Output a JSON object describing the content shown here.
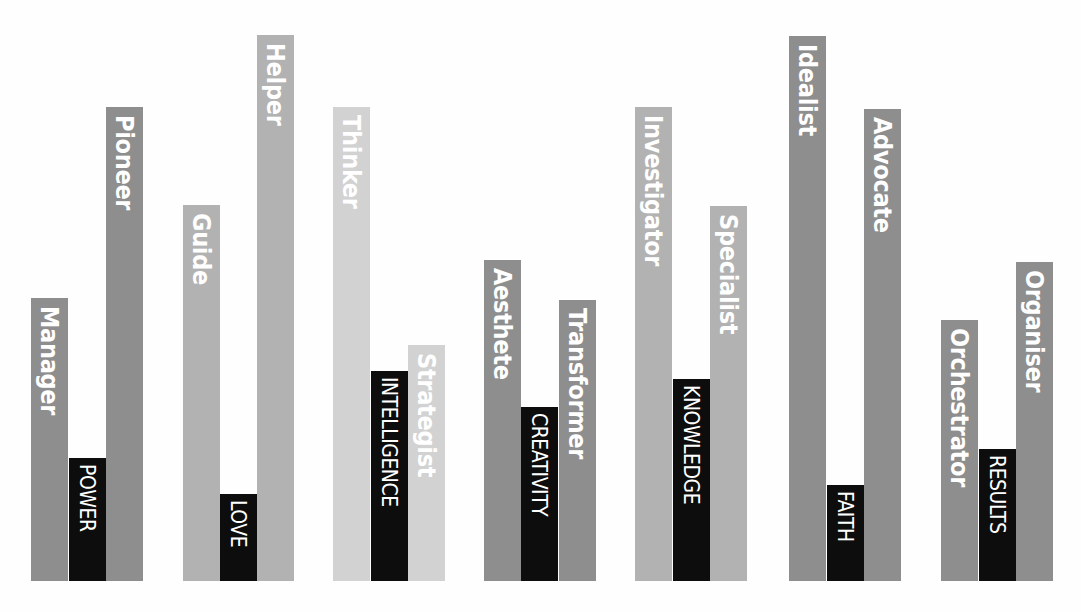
{
  "colors": {
    "dark": "#8e8e8e",
    "mid": "#b2b2b2",
    "light": "#d2d2d2",
    "core": "#0d0d0d"
  },
  "chart_data": {
    "type": "bar",
    "title": "",
    "xlabel": "",
    "ylabel": "",
    "baseline_y_px": 581,
    "groups": [
      {
        "core": "POWER",
        "left": "Manager",
        "right": "Pioneer",
        "shade": "dark",
        "values": {
          "left": 283,
          "core": 123,
          "right": 474
        }
      },
      {
        "core": "LOVE",
        "left": "Guide",
        "right": "Helper",
        "shade": "mid",
        "values": {
          "left": 376,
          "core": 87,
          "right": 546
        }
      },
      {
        "core": "INTELLIGENCE",
        "left": "Thinker",
        "right": "Strategist",
        "shade": "light",
        "values": {
          "left": 474,
          "core": 210,
          "right": 236
        }
      },
      {
        "core": "CREATIVITY",
        "left": "Aesthete",
        "right": "Transformer",
        "shade": "dark",
        "values": {
          "left": 321,
          "core": 174,
          "right": 281
        }
      },
      {
        "core": "KNOWLEDGE",
        "left": "Investigator",
        "right": "Specialist",
        "shade": "mid",
        "values": {
          "left": 474,
          "core": 202,
          "right": 375
        }
      },
      {
        "core": "FAITH",
        "left": "Idealist",
        "right": "Advocate",
        "shade": "dark",
        "values": {
          "left": 545,
          "core": 96,
          "right": 472
        }
      },
      {
        "core": "RESULTS",
        "left": "Orchestrator",
        "right": "Organiser",
        "shade": "dark",
        "values": {
          "left": 261,
          "core": 132,
          "right": 319
        }
      }
    ]
  },
  "bars": [
    {
      "name": "manager",
      "label": "Manager",
      "x": 31,
      "top": 298,
      "shade": "dark"
    },
    {
      "name": "power",
      "label": "POWER",
      "x": 69,
      "top": 458,
      "shade": "core"
    },
    {
      "name": "pioneer",
      "label": "Pioneer",
      "x": 106,
      "top": 107,
      "shade": "dark"
    },
    {
      "name": "guide",
      "label": "Guide",
      "x": 183,
      "top": 205,
      "shade": "mid"
    },
    {
      "name": "love",
      "label": "LOVE",
      "x": 220,
      "top": 494,
      "shade": "core"
    },
    {
      "name": "helper",
      "label": "Helper",
      "x": 257,
      "top": 35,
      "shade": "mid"
    },
    {
      "name": "thinker",
      "label": "Thinker",
      "x": 333,
      "top": 107,
      "shade": "light"
    },
    {
      "name": "intelligence",
      "label": "INTELLIGENCE",
      "x": 371,
      "top": 371,
      "shade": "core"
    },
    {
      "name": "strategist",
      "label": "Strategist",
      "x": 408,
      "top": 345,
      "shade": "light"
    },
    {
      "name": "aesthete",
      "label": "Aesthete",
      "x": 484,
      "top": 260,
      "shade": "dark"
    },
    {
      "name": "creativity",
      "label": "CREATIVITY",
      "x": 521,
      "top": 407,
      "shade": "core"
    },
    {
      "name": "transformer",
      "label": "Transformer",
      "x": 559,
      "top": 300,
      "shade": "dark"
    },
    {
      "name": "investigator",
      "label": "Investigator",
      "x": 635,
      "top": 107,
      "shade": "mid"
    },
    {
      "name": "knowledge",
      "label": "KNOWLEDGE",
      "x": 673,
      "top": 379,
      "shade": "core"
    },
    {
      "name": "specialist",
      "label": "Specialist",
      "x": 710,
      "top": 206,
      "shade": "mid"
    },
    {
      "name": "idealist",
      "label": "Idealist",
      "x": 789,
      "top": 36,
      "shade": "dark"
    },
    {
      "name": "faith",
      "label": "FAITH",
      "x": 827,
      "top": 485,
      "shade": "core"
    },
    {
      "name": "advocate",
      "label": "Advocate",
      "x": 864,
      "top": 109,
      "shade": "dark"
    },
    {
      "name": "orchestrator",
      "label": "Orchestrator",
      "x": 941,
      "top": 320,
      "shade": "dark"
    },
    {
      "name": "results",
      "label": "RESULTS",
      "x": 979,
      "top": 449,
      "shade": "core"
    },
    {
      "name": "organiser",
      "label": "Organiser",
      "x": 1016,
      "top": 262,
      "shade": "dark"
    }
  ]
}
